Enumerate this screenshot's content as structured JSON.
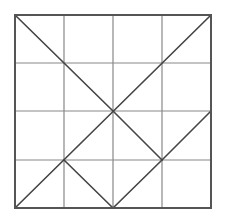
{
  "diagram": {
    "type": "geometric-grid",
    "grid": {
      "rows": 4,
      "cols": 4,
      "x_lines": [
        15,
        64,
        113,
        162,
        211
      ],
      "y_lines": [
        15,
        63,
        111,
        160,
        208
      ]
    },
    "colors": {
      "outer_border": "#555555",
      "grid_line": "#888888",
      "diagonal": "#444444",
      "background": "#ffffff"
    },
    "segments": [
      {
        "name": "diagonal-topleft-to-center",
        "x1": 15,
        "y1": 15,
        "x2": 113,
        "y2": 111
      },
      {
        "name": "diagonal-center-to-lower-right-node",
        "x1": 113,
        "y1": 111,
        "x2": 162,
        "y2": 160
      },
      {
        "name": "anti-diagonal-topright-to-bottomleft",
        "x1": 211,
        "y1": 15,
        "x2": 15,
        "y2": 208
      },
      {
        "name": "segment-right-middle-to-lower-right-node",
        "x1": 211,
        "y1": 111,
        "x2": 162,
        "y2": 160
      },
      {
        "name": "segment-lower-left-node-to-bottom-middle",
        "x1": 64,
        "y1": 160,
        "x2": 113,
        "y2": 208
      },
      {
        "name": "segment-lower-right-node-to-bottom-middle",
        "x1": 162,
        "y1": 160,
        "x2": 113,
        "y2": 208
      }
    ]
  }
}
